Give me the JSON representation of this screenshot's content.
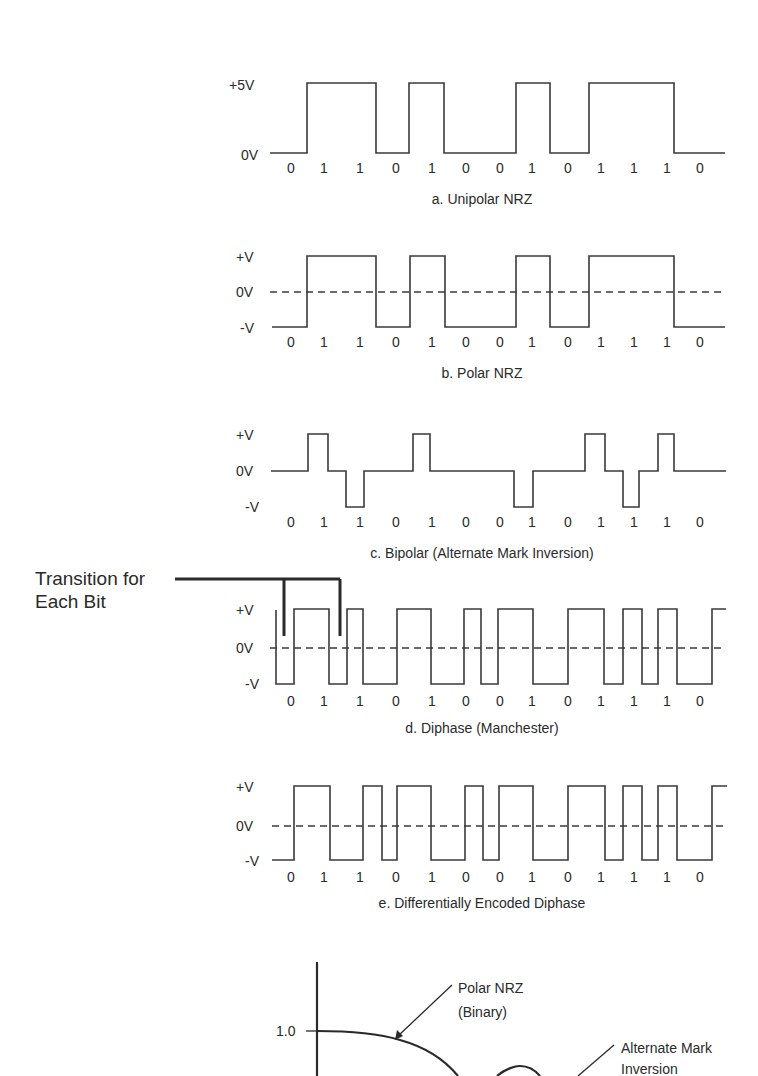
{
  "bits": [
    "0",
    "1",
    "1",
    "0",
    "1",
    "0",
    "0",
    "1",
    "0",
    "1",
    "1",
    "1",
    "0"
  ],
  "panels": [
    {
      "id": "unipolar",
      "caption": "a. Unipolar NRZ",
      "levels": {
        "high": "+5V",
        "low": "0V"
      },
      "dashed_zero": false
    },
    {
      "id": "polar",
      "caption": "b. Polar NRZ",
      "levels": {
        "high": "+V",
        "zero": "0V",
        "low": "-V"
      },
      "dashed_zero": true
    },
    {
      "id": "bipolar",
      "caption": "c. Bipolar (Alternate Mark Inversion)",
      "levels": {
        "high": "+V",
        "zero": "0V",
        "low": "-V"
      },
      "dashed_zero": false
    },
    {
      "id": "manchester",
      "caption": "d. Diphase (Manchester)",
      "levels": {
        "high": "+V",
        "zero": "0V",
        "low": "-V"
      },
      "dashed_zero": true
    },
    {
      "id": "diff-manchester",
      "caption": "e. Differentially Encoded Diphase",
      "levels": {
        "high": "+V",
        "zero": "0V",
        "low": "-V"
      },
      "dashed_zero": true
    }
  ],
  "annotation": {
    "line1": "Transition for",
    "line2": "Each Bit"
  },
  "spectrum_plot": {
    "y_tick": "1.0",
    "curves": [
      {
        "name": "Polar NRZ",
        "sub": "(Binary)"
      },
      {
        "name": "Alternate Mark",
        "sub": "Inversion"
      }
    ]
  },
  "chart_data": {
    "type": "line",
    "bit_sequence": [
      0,
      1,
      1,
      0,
      1,
      0,
      0,
      1,
      0,
      1,
      1,
      1,
      0
    ],
    "series": [
      {
        "name": "a. Unipolar NRZ",
        "levels": [
          "0V",
          "+5V"
        ],
        "values": [
          0,
          1,
          1,
          0,
          1,
          0,
          0,
          1,
          0,
          1,
          1,
          1,
          0
        ]
      },
      {
        "name": "b. Polar NRZ",
        "levels": [
          "-V",
          "+V"
        ],
        "values": [
          -1,
          1,
          1,
          -1,
          1,
          -1,
          -1,
          1,
          -1,
          1,
          1,
          1,
          -1
        ]
      },
      {
        "name": "c. Bipolar (Alternate Mark Inversion)",
        "levels": [
          "-V",
          "0V",
          "+V"
        ],
        "values": [
          0,
          1,
          -1,
          0,
          1,
          0,
          0,
          -1,
          0,
          1,
          -1,
          1,
          0
        ]
      },
      {
        "name": "d. Diphase (Manchester)",
        "levels": [
          "-V",
          "+V"
        ],
        "half_bits": [
          [
            -1,
            1
          ],
          [
            1,
            -1
          ],
          [
            1,
            -1
          ],
          [
            -1,
            1
          ],
          [
            1,
            -1
          ],
          [
            -1,
            1
          ],
          [
            -1,
            1
          ],
          [
            1,
            -1
          ],
          [
            -1,
            1
          ],
          [
            1,
            -1
          ],
          [
            1,
            -1
          ],
          [
            1,
            -1
          ],
          [
            -1,
            1
          ]
        ]
      },
      {
        "name": "e. Differentially Encoded Diphase",
        "levels": [
          "-V",
          "+V"
        ],
        "half_bits": [
          [
            -1,
            1
          ],
          [
            1,
            -1
          ],
          [
            1,
            -1
          ],
          [
            1,
            -1
          ],
          [
            -1,
            1
          ],
          [
            1,
            -1
          ],
          [
            -1,
            1
          ],
          [
            1,
            -1
          ],
          [
            1,
            -1
          ],
          [
            -1,
            1
          ],
          [
            1,
            -1
          ],
          [
            1,
            -1
          ],
          [
            -1,
            1
          ]
        ]
      }
    ],
    "annotation": "Transition for Each Bit",
    "partial_plot": {
      "ytick": 1.0,
      "curves": [
        "Polar NRZ (Binary)",
        "Alternate Mark Inversion"
      ]
    }
  }
}
